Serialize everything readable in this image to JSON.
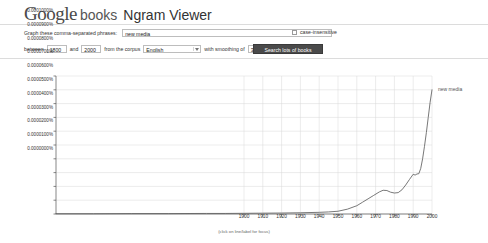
{
  "header": {
    "logo_google": "Google",
    "logo_books": "books",
    "logo_app": "Ngram Viewer"
  },
  "form": {
    "phrases_label": "Graph these comma-separated phrases:",
    "phrases_value": "new media",
    "phrases_placeholder": "",
    "case_insensitive_label": "case-insensitive",
    "case_insensitive_checked": false,
    "between_label": "between",
    "year_start": "1800",
    "year_end": "2000",
    "corpus_label": "from the corpus",
    "corpus_value": "English",
    "smoothing_label": "with smoothing of",
    "smoothing_value": "3",
    "and_label": "and",
    "search_button": "Search lots of books"
  },
  "chart_footer": "(click on line/label for focus)",
  "chart_data": {
    "type": "line",
    "title": "",
    "xlabel": "",
    "ylabel": "",
    "xlim": [
      1800,
      2000
    ],
    "ylim": [
      0.0,
      0.0001
    ],
    "grid": true,
    "legend": "right-inline",
    "xticks": [
      1900,
      1910,
      1920,
      1930,
      1940,
      1950,
      1960,
      1970,
      1980,
      1990,
      2000
    ],
    "xtick_labels": [
      "1900",
      "1910",
      "1920",
      "1930",
      "1940",
      "1950",
      "1960",
      "1970",
      "1980",
      "1990",
      "2000"
    ],
    "yticks": [
      0.0,
      1e-05,
      2e-05,
      3e-05,
      4e-05,
      5e-05,
      6e-05,
      7e-05,
      8e-05,
      9e-05,
      0.0001
    ],
    "ytick_labels": [
      "0.0000000%",
      "0.0000100%",
      "0.0000200%",
      "0.0000300%",
      "0.0000400%",
      "0.0000500%",
      "0.0000600%",
      "0.0000700%",
      "0.0000800%",
      "0.0000900%",
      "0.0001000%"
    ],
    "series": [
      {
        "name": "new media",
        "color": "#555555",
        "x": [
          1800,
          1820,
          1840,
          1860,
          1880,
          1890,
          1900,
          1910,
          1920,
          1930,
          1940,
          1945,
          1950,
          1955,
          1960,
          1963,
          1966,
          1969,
          1972,
          1974,
          1976,
          1978,
          1980,
          1982,
          1984,
          1986,
          1988,
          1990,
          1991,
          1992,
          1993,
          1994,
          1995,
          1996,
          1997,
          1998,
          1999,
          2000
        ],
        "values": [
          2e-07,
          2e-07,
          3e-07,
          3e-07,
          4e-07,
          4e-07,
          5e-07,
          6e-07,
          7e-07,
          9e-07,
          1.2e-06,
          1.5e-06,
          2e-06,
          3.5e-06,
          6e-06,
          8.5e-06,
          1.1e-05,
          1.35e-05,
          1.6e-05,
          1.72e-05,
          1.7e-05,
          1.58e-05,
          1.52e-05,
          1.55e-05,
          1.75e-05,
          2.1e-05,
          2.5e-05,
          2.88e-05,
          2.82e-05,
          2.9e-05,
          2.92e-05,
          3.3e-05,
          4e-05,
          4.9e-05,
          5.9e-05,
          7e-05,
          8.1e-05,
          9e-05
        ]
      }
    ]
  }
}
